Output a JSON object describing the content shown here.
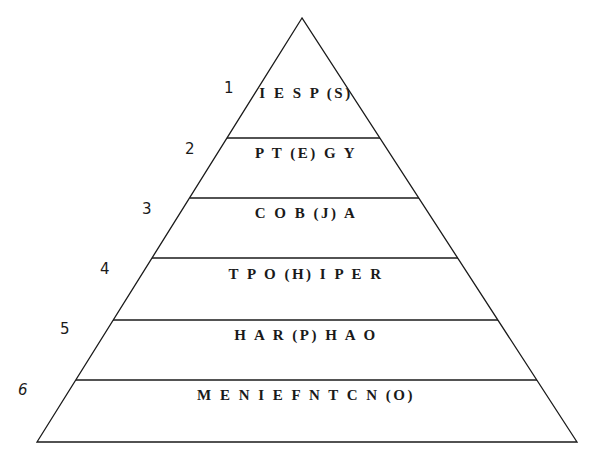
{
  "diagram": {
    "type": "pyramid",
    "stroke_color": "#1a1a1a",
    "background": "#ffffff",
    "levels": [
      {
        "number": "1",
        "text": "I E S P (S)"
      },
      {
        "number": "2",
        "text": "P T (E) G Y"
      },
      {
        "number": "3",
        "text": "C O B (J) A"
      },
      {
        "number": "4",
        "text": "T P O (H) I P E R"
      },
      {
        "number": "5",
        "text": "H A R (P) H A O"
      },
      {
        "number": "6",
        "text": "M E N I E F N T C N (O)"
      }
    ]
  }
}
